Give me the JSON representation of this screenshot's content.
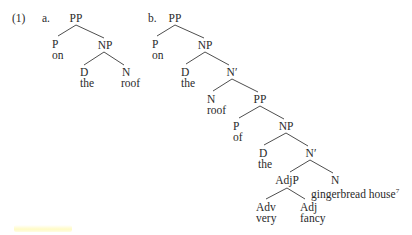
{
  "example": {
    "number": "(1)",
    "tree_a": {
      "label": "a.",
      "nodes": {
        "pp": "PP",
        "p": "P",
        "p_word": "on",
        "np": "NP",
        "d": "D",
        "d_word": "the",
        "n": "N",
        "n_word": "roof"
      }
    },
    "tree_b": {
      "label": "b.",
      "nodes": {
        "pp": "PP",
        "p": "P",
        "p_word": "on",
        "np": "NP",
        "d": "D",
        "d_word": "the",
        "nbar": "N′",
        "n": "N",
        "n_word": "roof",
        "pp2": "PP",
        "p2": "P",
        "p2_word": "of",
        "np2": "NP",
        "d2": "D",
        "d2_word": "the",
        "nbar2": "N′",
        "adjp": "AdjP",
        "n2": "N",
        "n2_word": "gingerbread house",
        "footnote": "7",
        "adv": "Adv",
        "adv_word": "very",
        "adj": "Adj",
        "adj_word": "fancy"
      }
    }
  },
  "colors": {
    "text": "#2a2a2a",
    "lines": "#3a3a3a",
    "highlight": "#fffabe"
  }
}
